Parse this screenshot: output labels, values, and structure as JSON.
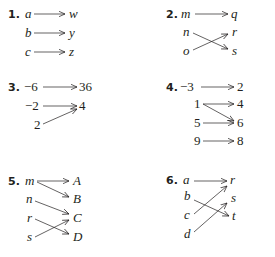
{
  "problems": [
    {
      "number": "1.",
      "style": "var",
      "domain": [
        {
          "label": "a",
          "x": 25,
          "y": 18
        },
        {
          "label": "b",
          "x": 25,
          "y": 37
        },
        {
          "label": "c",
          "x": 25,
          "y": 56
        }
      ],
      "range": [
        {
          "label": "w",
          "x": 69,
          "y": 18
        },
        {
          "label": "y",
          "x": 69,
          "y": 37
        },
        {
          "label": "z",
          "x": 69,
          "y": 56
        }
      ],
      "numpos": {
        "x": 8,
        "y": 18
      },
      "arrows": [
        [
          34,
          14,
          65,
          14
        ],
        [
          34,
          33,
          65,
          33
        ],
        [
          34,
          52,
          65,
          52
        ]
      ]
    },
    {
      "number": "2.",
      "style": "var",
      "domain": [
        {
          "label": "m",
          "x": 181,
          "y": 18
        },
        {
          "label": "n",
          "x": 183,
          "y": 36
        },
        {
          "label": "o",
          "x": 183,
          "y": 55
        }
      ],
      "range": [
        {
          "label": "q",
          "x": 231,
          "y": 18
        },
        {
          "label": "r",
          "x": 232,
          "y": 36
        },
        {
          "label": "s",
          "x": 232,
          "y": 55
        }
      ],
      "numpos": {
        "x": 166,
        "y": 18
      },
      "arrows": [
        [
          195,
          14,
          228,
          14
        ],
        [
          193,
          33,
          228,
          49
        ],
        [
          193,
          50,
          228,
          34
        ]
      ]
    },
    {
      "number": "3.",
      "style": "val",
      "domain": [
        {
          "label": "−6",
          "x": 24,
          "y": 91
        },
        {
          "label": "−2",
          "x": 25,
          "y": 110
        },
        {
          "label": "2",
          "x": 34,
          "y": 129
        }
      ],
      "range": [
        {
          "label": "36",
          "x": 79,
          "y": 91
        },
        {
          "label": "4",
          "x": 79,
          "y": 110
        }
      ],
      "numpos": {
        "x": 8,
        "y": 91
      },
      "arrows": [
        [
          43,
          87,
          77,
          87
        ],
        [
          43,
          106,
          77,
          106
        ],
        [
          43,
          124,
          77,
          109
        ]
      ]
    },
    {
      "number": "4.",
      "style": "val",
      "domain": [
        {
          "label": "−3",
          "x": 180,
          "y": 91
        },
        {
          "label": "1",
          "x": 194,
          "y": 108
        },
        {
          "label": "5",
          "x": 194,
          "y": 127
        },
        {
          "label": "9",
          "x": 194,
          "y": 145
        }
      ],
      "range": [
        {
          "label": "2",
          "x": 237,
          "y": 91
        },
        {
          "label": "4",
          "x": 237,
          "y": 108
        },
        {
          "label": "6",
          "x": 237,
          "y": 127
        },
        {
          "label": "8",
          "x": 237,
          "y": 145
        }
      ],
      "numpos": {
        "x": 166,
        "y": 91
      },
      "arrows": [
        [
          201,
          87,
          234,
          87
        ],
        [
          203,
          104,
          234,
          104
        ],
        [
          203,
          104,
          234,
          121
        ],
        [
          203,
          123,
          234,
          123
        ],
        [
          203,
          141,
          234,
          141
        ]
      ]
    },
    {
      "number": "5.",
      "style": "var",
      "domain": [
        {
          "label": "m",
          "x": 25,
          "y": 185
        },
        {
          "label": "n",
          "x": 26,
          "y": 203
        },
        {
          "label": "r",
          "x": 27,
          "y": 222
        },
        {
          "label": "s",
          "x": 27,
          "y": 241
        }
      ],
      "range": [
        {
          "label": "A",
          "x": 73,
          "y": 185
        },
        {
          "label": "B",
          "x": 73,
          "y": 203
        },
        {
          "label": "C",
          "x": 73,
          "y": 222
        },
        {
          "label": "D",
          "x": 73,
          "y": 241
        }
      ],
      "numpos": {
        "x": 8,
        "y": 185
      },
      "arrows": [
        [
          37,
          181,
          69,
          181
        ],
        [
          37,
          182,
          69,
          197
        ],
        [
          35,
          201,
          69,
          214
        ],
        [
          35,
          219,
          69,
          234
        ],
        [
          35,
          237,
          69,
          220
        ]
      ]
    },
    {
      "number": "6.",
      "style": "var",
      "domain": [
        {
          "label": "a",
          "x": 183,
          "y": 184
        },
        {
          "label": "b",
          "x": 184,
          "y": 200
        },
        {
          "label": "c",
          "x": 184,
          "y": 219
        },
        {
          "label": "d",
          "x": 184,
          "y": 238
        }
      ],
      "range": [
        {
          "label": "r",
          "x": 230,
          "y": 184
        },
        {
          "label": "s",
          "x": 231,
          "y": 202
        },
        {
          "label": "t",
          "x": 232,
          "y": 220
        }
      ],
      "numpos": {
        "x": 166,
        "y": 184
      },
      "arrows": [
        [
          194,
          181,
          227,
          181
        ],
        [
          194,
          200,
          229,
          216
        ],
        [
          194,
          214,
          227,
          186
        ],
        [
          194,
          232,
          227,
          203
        ]
      ]
    }
  ]
}
